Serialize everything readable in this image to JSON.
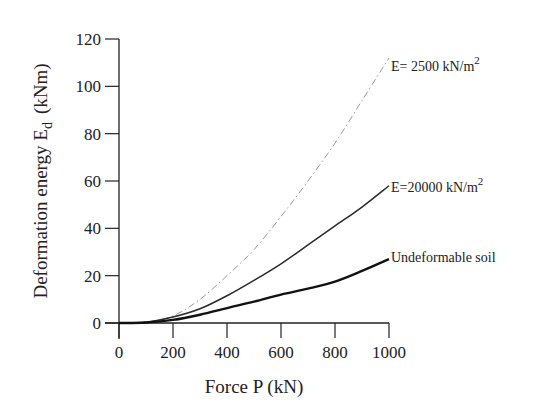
{
  "chart_data": {
    "type": "line",
    "title": "",
    "xlabel": "Force  P  (kN)",
    "ylabel_main": "Deformation  energy  E",
    "ylabel_sub": "d",
    "ylabel_unit": "(kNm)",
    "xlim": [
      0,
      1000
    ],
    "ylim": [
      0,
      120
    ],
    "xticks": [
      0,
      200,
      400,
      600,
      800,
      1000
    ],
    "yticks": [
      0,
      20,
      40,
      60,
      80,
      100,
      120
    ],
    "grid": false,
    "legend": "inline annotations at curve ends",
    "x": [
      0,
      100,
      200,
      300,
      400,
      500,
      600,
      700,
      800,
      900,
      1000
    ],
    "series": [
      {
        "name": "E=  2500  kN/m2",
        "label_main": "E=  2500  kN/m",
        "label_sup": "2",
        "style": "dash-dot",
        "color": "#9a9a9a",
        "values": [
          0,
          0.5,
          3,
          10,
          20,
          31,
          45,
          60,
          76,
          94,
          112
        ]
      },
      {
        "name": "E=20000  kN/m2",
        "label_main": "E=20000  kN/m",
        "label_sup": "2",
        "style": "solid-thin",
        "color": "#2a2a2a",
        "values": [
          0,
          0.3,
          2.5,
          6,
          11.5,
          18,
          25,
          33,
          41,
          49,
          58
        ]
      },
      {
        "name": "Undeformable soil",
        "label_main": "Undeformable  soil",
        "label_sup": "",
        "style": "solid-thick",
        "color": "#111111",
        "values": [
          0,
          0.2,
          1.3,
          3.5,
          6.3,
          9,
          12,
          14.5,
          17.5,
          22,
          27
        ]
      }
    ]
  }
}
